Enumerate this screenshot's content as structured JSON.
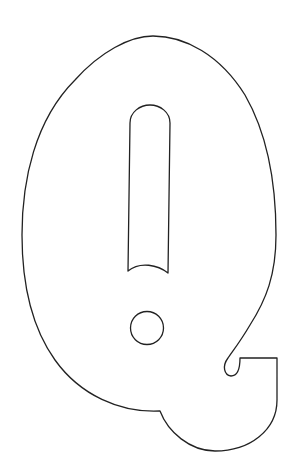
{
  "image": {
    "subject": "Outline of a bubble letter Q with exclamation mark cut-out",
    "letter": "Q",
    "style": "coloring-page line art",
    "colors": {
      "background": "#ffffff",
      "stroke": "#222222"
    }
  }
}
